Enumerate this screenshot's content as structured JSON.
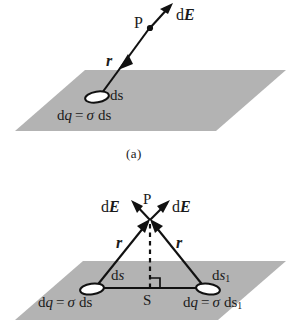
{
  "figure": {
    "type": "physics-diagram",
    "plane_color": "#b3b3b3",
    "line_color": "#111111",
    "panels": [
      {
        "id": "a",
        "caption": "(a)",
        "point_label": "P",
        "distance_label": "r",
        "field_label_d": "d",
        "field_label_E": "E",
        "element_label_d": "d",
        "element_label_s": "s",
        "charge_eq": {
          "d1": "d",
          "q": "q",
          "eq": "=",
          "sigma": "σ",
          "d2": "d",
          "s": "s"
        }
      },
      {
        "id": "b",
        "caption": "",
        "point_label": "P",
        "foot_label": "S",
        "distance_label_left": "r",
        "distance_label_right": "r",
        "field_label_left_d": "d",
        "field_label_left_E": "E",
        "field_label_right_d": "d",
        "field_label_right_E": "E",
        "element_left": {
          "d": "d",
          "s": "s"
        },
        "element_right": {
          "d": "d",
          "s": "s",
          "sub": "1"
        },
        "charge_eq_left": {
          "d1": "d",
          "q": "q",
          "eq": "=",
          "sigma": "σ",
          "d2": "d",
          "s": "s"
        },
        "charge_eq_right": {
          "d1": "d",
          "q": "q",
          "eq": "=",
          "sigma": "σ",
          "d2": "d",
          "s": "s",
          "sub": "1"
        }
      }
    ]
  }
}
